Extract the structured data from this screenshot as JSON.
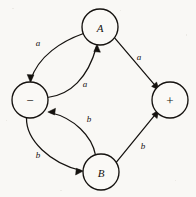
{
  "diagram": {
    "type": "state-transition-diagram",
    "background_color": "#f9f8f5",
    "ink_color": "#15120f",
    "nodes": [
      {
        "id": "A",
        "label": "A",
        "cx": 100,
        "cy": 27,
        "r": 18,
        "style": "italic"
      },
      {
        "id": "minus",
        "label": "−",
        "cx": 30,
        "cy": 100,
        "r": 18,
        "style": "symbol"
      },
      {
        "id": "plus",
        "label": "+",
        "cx": 170,
        "cy": 100,
        "r": 18,
        "style": "symbol"
      },
      {
        "id": "B",
        "label": "B",
        "cx": 101,
        "cy": 172,
        "r": 18,
        "style": "italic"
      }
    ],
    "edges": [
      {
        "id": "A-to-minus",
        "from": "A",
        "to": "minus",
        "label": "a",
        "label_x": 38,
        "label_y": 43,
        "shape": "curve-outer"
      },
      {
        "id": "minus-to-A",
        "from": "minus",
        "to": "A",
        "label": "a",
        "label_x": 85,
        "label_y": 84,
        "shape": "curve-inner"
      },
      {
        "id": "A-to-plus",
        "from": "A",
        "to": "plus",
        "label": "a",
        "label_x": 139,
        "label_y": 57,
        "shape": "straight"
      },
      {
        "id": "minus-to-B",
        "from": "minus",
        "to": "B",
        "label": "b",
        "label_x": 38,
        "label_y": 155,
        "shape": "curve-outer"
      },
      {
        "id": "B-to-minus",
        "from": "B",
        "to": "minus",
        "label": "b",
        "label_x": 89,
        "label_y": 119,
        "shape": "curve-inner"
      },
      {
        "id": "B-to-plus",
        "from": "B",
        "to": "plus",
        "label": "b",
        "label_x": 143,
        "label_y": 146,
        "shape": "straight"
      }
    ]
  }
}
